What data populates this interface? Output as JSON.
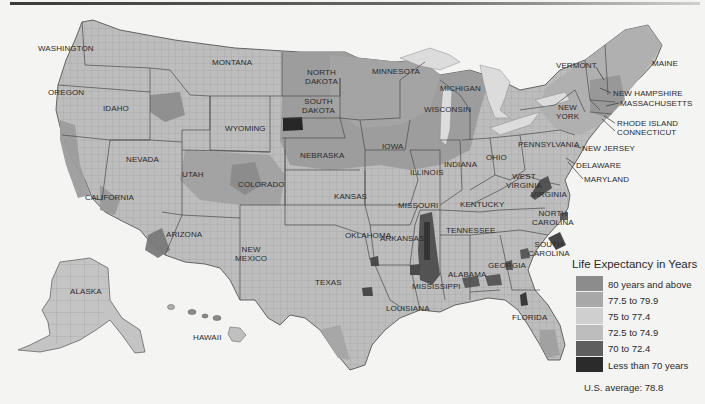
{
  "map": {
    "title_rule": true,
    "subject": "Life expectancy by U.S. county",
    "states": [
      {
        "id": "washington",
        "label": "WASHINGTON",
        "x": 38,
        "y": 44
      },
      {
        "id": "oregon",
        "label": "OREGON",
        "x": 48,
        "y": 88
      },
      {
        "id": "idaho",
        "label": "IDAHO",
        "x": 103,
        "y": 104
      },
      {
        "id": "montana",
        "label": "MONTANA",
        "x": 212,
        "y": 58
      },
      {
        "id": "wyoming",
        "label": "WYOMING",
        "x": 225,
        "y": 124
      },
      {
        "id": "nevada",
        "label": "NEVADA",
        "x": 126,
        "y": 155
      },
      {
        "id": "utah",
        "label": "UTAH",
        "x": 182,
        "y": 170
      },
      {
        "id": "colorado",
        "label": "COLORADO",
        "x": 238,
        "y": 180
      },
      {
        "id": "california",
        "label": "CALIFORNIA",
        "x": 85,
        "y": 193
      },
      {
        "id": "arizona",
        "label": "ARIZONA",
        "x": 166,
        "y": 230
      },
      {
        "id": "new-mexico",
        "label": "NEW\nMEXICO",
        "x": 235,
        "y": 245
      },
      {
        "id": "north-dakota",
        "label": "NORTH\nDAKOTA",
        "x": 305,
        "y": 68
      },
      {
        "id": "south-dakota",
        "label": "SOUTH\nDAKOTA",
        "x": 302,
        "y": 97
      },
      {
        "id": "nebraska",
        "label": "NEBRASKA",
        "x": 300,
        "y": 151
      },
      {
        "id": "kansas",
        "label": "KANSAS",
        "x": 334,
        "y": 192
      },
      {
        "id": "oklahoma",
        "label": "OKLAHOMA",
        "x": 345,
        "y": 231
      },
      {
        "id": "texas",
        "label": "TEXAS",
        "x": 315,
        "y": 278
      },
      {
        "id": "minnesota",
        "label": "MINNESOTA",
        "x": 372,
        "y": 67
      },
      {
        "id": "iowa",
        "label": "IOWA",
        "x": 382,
        "y": 142
      },
      {
        "id": "missouri",
        "label": "MISSOURI",
        "x": 398,
        "y": 201
      },
      {
        "id": "arkansas",
        "label": "ARKANSAS",
        "x": 405,
        "y": 233
      },
      {
        "id": "louisiana",
        "label": "LOUISIANA",
        "x": 405,
        "y": 302
      },
      {
        "id": "wisconsin",
        "label": "WISCONSIN",
        "x": 441,
        "y": 105
      },
      {
        "id": "michigan",
        "label": "MICHIGAN",
        "x": 459,
        "y": 84
      },
      {
        "id": "illinois",
        "label": "ILLINOIS",
        "x": 431,
        "y": 168
      },
      {
        "id": "indiana",
        "label": "INDIANA",
        "x": 463,
        "y": 160
      },
      {
        "id": "ohio",
        "label": "OHIO",
        "x": 496,
        "y": 155
      },
      {
        "id": "kentucky",
        "label": "KENTUCKY",
        "x": 475,
        "y": 202
      },
      {
        "id": "tennessee",
        "label": "TENNESSEE",
        "x": 470,
        "y": 226
      },
      {
        "id": "mississippi",
        "label": "MISSISSIPPI",
        "x": 432,
        "y": 284
      },
      {
        "id": "alabama",
        "label": "ALABAMA",
        "x": 466,
        "y": 270
      },
      {
        "id": "georgia",
        "label": "GEORGIA",
        "x": 510,
        "y": 261
      },
      {
        "id": "florida",
        "label": "FLORIDA",
        "x": 528,
        "y": 313
      },
      {
        "id": "south-carolina",
        "label": "SOUTH\nCAROLINA",
        "x": 534,
        "y": 240
      },
      {
        "id": "north-carolina",
        "label": "NORTH\nCAROLINA",
        "x": 540,
        "y": 212
      },
      {
        "id": "virginia",
        "label": "VIRGINIA",
        "x": 546,
        "y": 192
      },
      {
        "id": "west-virginia",
        "label": "WEST\nVIRGINIA",
        "x": 520,
        "y": 175
      },
      {
        "id": "pennsylvania",
        "label": "PENNSYLVANIA",
        "x": 545,
        "y": 143
      },
      {
        "id": "new-york",
        "label": "NEW\nYORK",
        "x": 572,
        "y": 107
      },
      {
        "id": "alaska",
        "label": "ALASKA",
        "x": 80,
        "y": 290
      },
      {
        "id": "hawaii",
        "label": "HAWAII",
        "x": 205,
        "y": 335
      }
    ],
    "callouts": [
      {
        "id": "vermont",
        "label": "VERMONT",
        "x": 592,
        "y": 60,
        "tx": 616,
        "ty": 74
      },
      {
        "id": "maine",
        "label": "MAINE",
        "x": 656,
        "y": 59,
        "tx": 0,
        "ty": 0
      },
      {
        "id": "new-hampshire",
        "label": "NEW HAMPSHIRE",
        "x": 622,
        "y": 89,
        "tx": 608,
        "ty": 84
      },
      {
        "id": "massachusetts",
        "label": "MASSACHUSETTS",
        "x": 621,
        "y": 100,
        "tx": 608,
        "ty": 104
      },
      {
        "id": "rhode-island",
        "label": "RHODE ISLAND",
        "x": 617,
        "y": 120,
        "tx": 608,
        "ty": 114
      },
      {
        "id": "connecticut",
        "label": "CONNECTICUT",
        "x": 617,
        "y": 129,
        "tx": 0,
        "ty": 0
      },
      {
        "id": "new-jersey",
        "label": "NEW JERSEY",
        "x": 583,
        "y": 143,
        "tx": 0,
        "ty": 0
      },
      {
        "id": "delaware",
        "label": "DELAWARE",
        "x": 578,
        "y": 160,
        "tx": 566,
        "ty": 152
      },
      {
        "id": "maryland",
        "label": "MARYLAND",
        "x": 585,
        "y": 175,
        "tx": 568,
        "ty": 160
      }
    ]
  },
  "legend": {
    "title": "Life Expectancy in Years",
    "items": [
      {
        "label": "80 years and above",
        "color": "#8c8c8c"
      },
      {
        "label": "77.5 to 79.9",
        "color": "#a8a8a8"
      },
      {
        "label": "75 to 77.4",
        "color": "#cfcfcf"
      },
      {
        "label": "72.5 to 74.9",
        "color": "#bdbdbd"
      },
      {
        "label": "70 to 72.4",
        "color": "#5e5e5e"
      },
      {
        "label": "Less than 70 years",
        "color": "#2b2b2b"
      }
    ],
    "average_label": "U.S. average:",
    "average_value": "78.8"
  },
  "colors": {
    "background": "#f4f4f2",
    "land_default": "#bdbdbd",
    "border": "#555555",
    "water": "#f4f4f2"
  }
}
